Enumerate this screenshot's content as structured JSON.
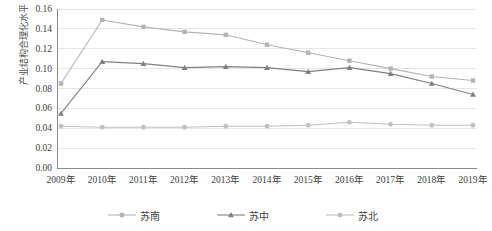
{
  "chart_data": {
    "type": "line",
    "title": "",
    "xlabel": "",
    "ylabel": "产业结构合理化水平",
    "categories": [
      "2009年",
      "2010年",
      "2011年",
      "2012年",
      "2013年",
      "2014年",
      "2015年",
      "2016年",
      "2017年",
      "2018年",
      "2019年"
    ],
    "ylim": [
      0.0,
      0.16
    ],
    "ytick_step": 0.02,
    "yticks": [
      "0.16",
      "0.14",
      "0.12",
      "0.10",
      "0.08",
      "0.06",
      "0.04",
      "0.02",
      "0.00"
    ],
    "grid": true,
    "grid_axis": "y",
    "legend_position": "bottom",
    "series": [
      {
        "name": "苏南",
        "color": "#b3b3b3",
        "marker": "square",
        "values": [
          0.085,
          0.149,
          0.142,
          0.137,
          0.134,
          0.124,
          0.116,
          0.108,
          0.1,
          0.092,
          0.088
        ]
      },
      {
        "name": "苏中",
        "color": "#808080",
        "marker": "triangle",
        "values": [
          0.055,
          0.107,
          0.105,
          0.101,
          0.102,
          0.101,
          0.097,
          0.101,
          0.095,
          0.085,
          0.074
        ]
      },
      {
        "name": "苏北",
        "color": "#c0c0c0",
        "marker": "circle",
        "values": [
          0.042,
          0.041,
          0.041,
          0.041,
          0.042,
          0.042,
          0.043,
          0.046,
          0.044,
          0.043,
          0.043
        ]
      }
    ]
  },
  "legend": {
    "items": [
      {
        "label": "苏南"
      },
      {
        "label": "苏中"
      },
      {
        "label": "苏北"
      }
    ]
  },
  "colors": {
    "gridline": "#e6e6e6",
    "axis": "#808080",
    "background": "#ffffff",
    "text": "#404040"
  }
}
